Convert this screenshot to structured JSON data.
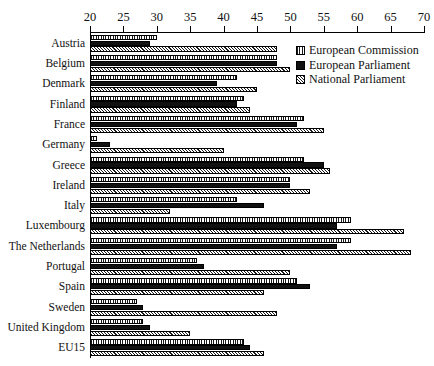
{
  "chart_data": {
    "type": "bar",
    "orientation": "horizontal",
    "title": "",
    "xlabel": "",
    "ylabel": "",
    "xlim": [
      20,
      70
    ],
    "xticks": [
      20,
      25,
      30,
      35,
      40,
      45,
      50,
      55,
      60,
      65,
      70
    ],
    "grid": false,
    "legend_position": "top-right",
    "categories": [
      "Austria",
      "Belgium",
      "Denmark",
      "Finland",
      "France",
      "Germany",
      "Greece",
      "Ireland",
      "Italy",
      "Luxembourg",
      "The Netherlands",
      "Portugal",
      "Spain",
      "Sweden",
      "United Kingdom",
      "EU15"
    ],
    "series": [
      {
        "name": "European Commission",
        "pattern": "vertical-hatch",
        "values": [
          30,
          48,
          42,
          43,
          52,
          21,
          52,
          50,
          42,
          59,
          59,
          36,
          51,
          27,
          28,
          43
        ]
      },
      {
        "name": "European Parliament",
        "pattern": "solid-black",
        "values": [
          29,
          48,
          39,
          42,
          51,
          23,
          55,
          50,
          46,
          57,
          57,
          37,
          53,
          28,
          29,
          44
        ]
      },
      {
        "name": "National Parliament",
        "pattern": "crosshatch",
        "values": [
          48,
          50,
          45,
          44,
          55,
          40,
          56,
          53,
          32,
          67,
          68,
          50,
          46,
          48,
          35,
          46
        ]
      }
    ]
  },
  "legend": {
    "items": [
      {
        "label": "European Commission",
        "swatch": "ec"
      },
      {
        "label": "European Parliament",
        "swatch": "ep"
      },
      {
        "label": "National Parliament",
        "swatch": "np"
      }
    ]
  }
}
